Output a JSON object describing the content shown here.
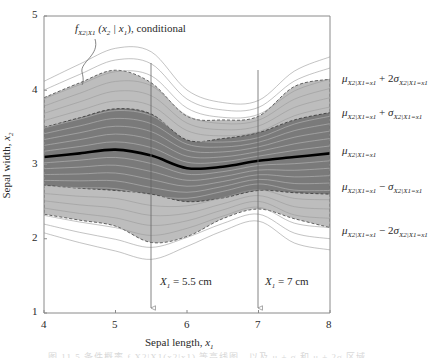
{
  "chart_data": {
    "type": "area",
    "title": "",
    "xlabel": "Sepal length, x1",
    "ylabel": "Sepal width, x2",
    "xlim": [
      4,
      8
    ],
    "ylim": [
      1,
      5
    ],
    "xticks": [
      "4",
      "5",
      "6",
      "7",
      "8"
    ],
    "yticks": [
      "1",
      "2",
      "3",
      "4",
      "5"
    ],
    "grid": false,
    "x": [
      4,
      4.5,
      5,
      5.5,
      6,
      6.5,
      7,
      7.5,
      8
    ],
    "series": [
      {
        "name": "μ X2|X1=x1 + 2σ X2|X1=x1",
        "values": [
          3.9,
          4.1,
          4.27,
          4.1,
          3.65,
          3.6,
          3.65,
          4.05,
          4.15
        ]
      },
      {
        "name": "μ X2|X1=x1 + σ X2|X1=x1",
        "values": [
          3.5,
          3.63,
          3.75,
          3.68,
          3.33,
          3.35,
          3.43,
          3.6,
          3.7
        ]
      },
      {
        "name": "μ X2|X1=x1",
        "values": [
          3.1,
          3.15,
          3.2,
          3.12,
          2.95,
          2.97,
          3.05,
          3.1,
          3.15
        ]
      },
      {
        "name": "μ X2|X1=x1 − σ X2|X1=x1",
        "values": [
          2.72,
          2.68,
          2.65,
          2.6,
          2.5,
          2.55,
          2.65,
          2.62,
          2.6
        ]
      },
      {
        "name": "μ X2|X1=x1 − 2σ X2|X1=x1",
        "values": [
          2.33,
          2.25,
          2.17,
          1.95,
          2.03,
          2.27,
          2.4,
          2.27,
          2.15
        ]
      }
    ],
    "annotations": [
      {
        "text": "f X2|X1 (x2 | x1), conditional",
        "x": 5.0,
        "y": 4.7
      },
      {
        "text": "X1 = 5.5 cm",
        "x": 5.5,
        "y": 1.4,
        "type": "vertical-arrow"
      },
      {
        "text": "X1 = 7 cm",
        "x": 7.0,
        "y": 1.4,
        "type": "vertical-arrow"
      }
    ],
    "legend_position": "right"
  },
  "labels": {
    "conditional": {
      "f": "f",
      "f_sub": "X2|X1",
      "args": "(x",
      "x2_sub": "2",
      "bar": " | x",
      "x1_sub": "1",
      "tail": "), conditional"
    },
    "ylabel": {
      "text": "Sepal width, ",
      "var": "x",
      "sub": "2"
    },
    "xlabel": {
      "text": "Sepal length, ",
      "var": "x",
      "sub": "1"
    },
    "cut1": {
      "var": "X",
      "sub": "1",
      "text": " = 5.5 cm"
    },
    "cut2": {
      "var": "X",
      "sub": "1",
      "text": " = 7 cm"
    },
    "legend": [
      {
        "mu": "μ",
        "mu_sub": "X2|X1=x1",
        "op": " + 2",
        "sig": "σ",
        "sig_sub": "X2|X1=x1"
      },
      {
        "mu": "μ",
        "mu_sub": "X2|X1=x1",
        "op": " + ",
        "sig": "σ",
        "sig_sub": "X2|X1=x1"
      },
      {
        "mu": "μ",
        "mu_sub": "X2|X1=x1",
        "op": "",
        "sig": "",
        "sig_sub": ""
      },
      {
        "mu": "μ",
        "mu_sub": "X2|X1=x1",
        "op": " − ",
        "sig": "σ",
        "sig_sub": "X2|X1=x1"
      },
      {
        "mu": "μ",
        "mu_sub": "X2|X1=x1",
        "op": " − 2",
        "sig": "σ",
        "sig_sub": "X2|X1=x1"
      }
    ]
  },
  "caption": "图 11.5 条件概率 f X2|X1(x2|x1) 等高线图，以及 μ ± σ 和 μ ± 2σ 区域",
  "colors": {
    "outer_band": "#bdbdbd",
    "inner_band": "#7a7a7a",
    "mean_line": "#000000",
    "contour": "#9a9a9a",
    "axis": "#8a8a8a"
  }
}
